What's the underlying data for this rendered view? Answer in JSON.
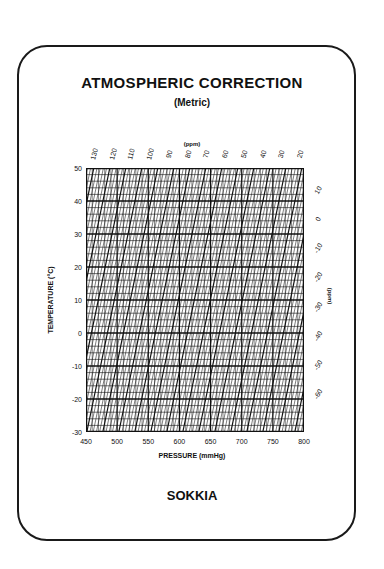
{
  "card": {
    "title": "ATMOSPHERIC CORRECTION",
    "subtitle": "(Metric)",
    "brand": "SOKKIA"
  },
  "chart_data": {
    "type": "heatmap",
    "title": "ATMOSPHERIC CORRECTION",
    "subtitle": "(Metric)",
    "xlabel": "PRESSURE (mmHg)",
    "ylabel": "TEMPERATURE (°C)",
    "x_ticks": [
      450,
      500,
      550,
      600,
      650,
      700,
      750,
      800
    ],
    "xlim": [
      450,
      800
    ],
    "y_ticks": [
      50,
      40,
      30,
      20,
      10,
      0,
      -10,
      -20,
      -30
    ],
    "ylim": [
      -30,
      50
    ],
    "top_axis_label": "(ppm)",
    "top_axis_ticks": [
      130,
      120,
      110,
      100,
      90,
      80,
      70,
      60,
      50,
      40,
      30,
      20
    ],
    "right_axis_label": "(ppm)",
    "right_axis_ticks": [
      10,
      0,
      -10,
      -20,
      -30,
      -40,
      -50,
      -60
    ],
    "grid": true
  },
  "colors": {
    "ink": "#111111",
    "background": "#ffffff"
  }
}
